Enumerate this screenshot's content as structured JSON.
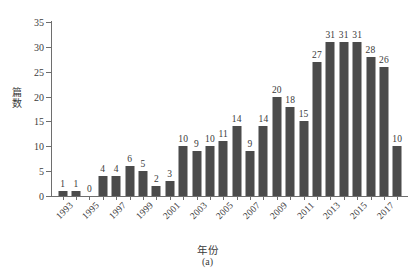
{
  "chart_data": {
    "type": "bar",
    "title": "",
    "subtitle": "",
    "caption": "(a)",
    "xlabel": "年份",
    "ylabel": "篇数",
    "categories": [
      1993,
      1994,
      1995,
      1996,
      1997,
      1998,
      1999,
      2000,
      2001,
      2002,
      2003,
      2004,
      2005,
      2006,
      2007,
      2008,
      2009,
      2010,
      2011,
      2012,
      2013,
      2014,
      2015,
      2016,
      2017,
      2018
    ],
    "values": [
      1,
      1,
      0,
      4,
      4,
      6,
      5,
      2,
      3,
      10,
      9,
      10,
      11,
      14,
      9,
      14,
      20,
      18,
      15,
      27,
      31,
      31,
      31,
      28,
      26,
      10
    ],
    "value_labels": [
      "1",
      "1",
      "0",
      "4",
      "4",
      "6",
      "5",
      "2",
      "3",
      "10",
      "9",
      "10",
      "11",
      "14",
      "9",
      "14",
      "20",
      "18",
      "15",
      "27",
      "31",
      "31",
      "31",
      "28",
      "26",
      "10"
    ],
    "ylim": [
      0,
      35
    ],
    "yticks": [
      0,
      5,
      10,
      15,
      20,
      25,
      30,
      35
    ],
    "ytick_labels": [
      "0",
      "5",
      "10",
      "15",
      "20",
      "25",
      "30",
      "35"
    ],
    "xtick_labels": [
      "1993",
      "1995",
      "1997",
      "1999",
      "2001",
      "2003",
      "2005",
      "2007",
      "2009",
      "2011",
      "2013",
      "2015",
      "2017"
    ],
    "xtick_categories": [
      1993,
      1995,
      1997,
      1999,
      2001,
      2003,
      2005,
      2007,
      2009,
      2011,
      2013,
      2015,
      2017
    ],
    "grid": false,
    "legend": false,
    "bar_color": "#4b4b4b",
    "axis_color": "#6e6e6e",
    "text_color": "#3a3a3a",
    "background": "#ffffff"
  }
}
